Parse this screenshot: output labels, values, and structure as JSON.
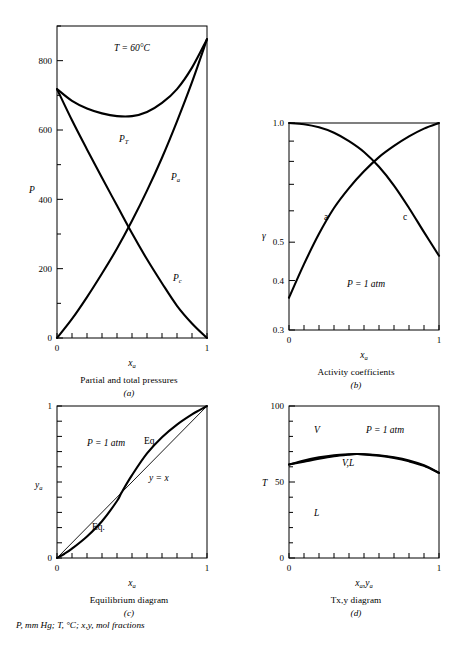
{
  "figure": {
    "footnote": "P, mm Hg; T, °C; x,y, mol fractions"
  },
  "panels": {
    "a": {
      "caption": "Partial and total pressures",
      "sublabel": "(a)",
      "annotation": "T  =  60°C",
      "ylabel": "P",
      "xlabel_main": "x",
      "xlabel_sub": "a",
      "x_ticks": [
        "0",
        "1"
      ],
      "y_ticks": [
        "200",
        "400",
        "600",
        "800"
      ],
      "y_zero": "0",
      "curve_labels": [
        {
          "main": "P",
          "sub": "T"
        },
        {
          "main": "P",
          "sub": "a"
        },
        {
          "main": "P",
          "sub": "c"
        }
      ]
    },
    "b": {
      "caption": "Activity coefficients",
      "sublabel": "(b)",
      "annotation": "P  =  1 atm",
      "ylabel": "γ",
      "xlabel_main": "x",
      "xlabel_sub": "a",
      "x_ticks": [
        "0",
        "1"
      ],
      "y_ticks": [
        "1.0",
        "0.5",
        "0.4",
        "0.3"
      ],
      "curve_labels": [
        "a",
        "c"
      ]
    },
    "c": {
      "caption": "Equilibrium diagram",
      "sublabel": "(c)",
      "annotation": "P  =  1 atm",
      "ylabel_main": "y",
      "ylabel_sub": "a",
      "xlabel_main": "x",
      "xlabel_sub": "a",
      "x_ticks": [
        "0",
        "1"
      ],
      "y_ticks": [
        "0",
        "1"
      ],
      "curve_labels": [
        "Eq.",
        "Eq."
      ],
      "diagonal_label": "y  =  x"
    },
    "d": {
      "caption": "Tx,y diagram",
      "sublabel": "(d)",
      "annotation": "P  =  1 atm",
      "ylabel": "T",
      "xlabel_main_1": "x",
      "xlabel_sub_1": "a",
      "xlabel_main_2": "y",
      "xlabel_sub_2": "a",
      "x_ticks": [
        "0",
        "1"
      ],
      "y_ticks": [
        "0",
        "50",
        "100"
      ],
      "region_labels": [
        "V",
        "V,L",
        "L"
      ]
    }
  },
  "chart_data": [
    {
      "type": "line",
      "panel": "a",
      "title": "Partial and total pressures",
      "xlabel": "x_a",
      "ylabel": "P",
      "xlim": [
        0,
        1
      ],
      "ylim": [
        0,
        900
      ],
      "y_tick_values": [
        0,
        200,
        400,
        600,
        800
      ],
      "y_minor_step": 100,
      "x_tick_values": [
        0,
        1
      ],
      "x_minor_count": 9,
      "grid": false,
      "annotation": "T = 60°C",
      "series": [
        {
          "name": "P_T",
          "label": "P_T",
          "x": [
            0,
            0.1,
            0.2,
            0.3,
            0.4,
            0.5,
            0.6,
            0.7,
            0.8,
            0.9,
            1.0
          ],
          "values": [
            718,
            684,
            662,
            648,
            640,
            640,
            652,
            678,
            718,
            780,
            862
          ]
        },
        {
          "name": "P_a",
          "label": "P_a",
          "x": [
            0,
            0.1,
            0.2,
            0.3,
            0.4,
            0.5,
            0.6,
            0.7,
            0.8,
            0.9,
            1.0
          ],
          "values": [
            0,
            55,
            118,
            186,
            258,
            338,
            425,
            520,
            625,
            738,
            862
          ]
        },
        {
          "name": "P_c",
          "label": "P_c",
          "x": [
            0,
            0.1,
            0.2,
            0.3,
            0.4,
            0.5,
            0.6,
            0.7,
            0.8,
            0.9,
            1.0
          ],
          "values": [
            718,
            628,
            544,
            462,
            382,
            302,
            227,
            158,
            93,
            42,
            0
          ]
        }
      ]
    },
    {
      "type": "line",
      "panel": "b",
      "title": "Activity coefficients",
      "xlabel": "x_a",
      "ylabel": "γ",
      "xlim": [
        0,
        1
      ],
      "ylim": [
        0.3,
        1.0
      ],
      "yscale": "log",
      "y_tick_values": [
        0.3,
        0.4,
        0.5,
        0.6,
        0.7,
        0.8,
        0.9,
        1.0
      ],
      "y_labeled_ticks": [
        0.3,
        0.4,
        0.5,
        1.0
      ],
      "x_tick_values": [
        0,
        1
      ],
      "x_minor_count": 9,
      "grid": false,
      "annotation": "P = 1 atm",
      "series": [
        {
          "name": "gamma_a",
          "label": "a",
          "x": [
            0,
            0.1,
            0.2,
            0.3,
            0.4,
            0.5,
            0.6,
            0.7,
            0.8,
            0.9,
            1.0
          ],
          "values": [
            0.362,
            0.44,
            0.525,
            0.61,
            0.685,
            0.755,
            0.82,
            0.875,
            0.925,
            0.968,
            1.0
          ]
        },
        {
          "name": "gamma_c",
          "label": "c",
          "x": [
            0,
            0.1,
            0.2,
            0.3,
            0.4,
            0.5,
            0.6,
            0.7,
            0.8,
            0.9,
            1.0
          ],
          "values": [
            1.0,
            0.993,
            0.975,
            0.945,
            0.9,
            0.845,
            0.775,
            0.695,
            0.61,
            0.53,
            0.462
          ]
        }
      ]
    },
    {
      "type": "line",
      "panel": "c",
      "title": "Equilibrium diagram",
      "xlabel": "x_a",
      "ylabel": "y_a",
      "xlim": [
        0,
        1
      ],
      "ylim": [
        0,
        1
      ],
      "y_tick_values": [
        0,
        1
      ],
      "x_tick_values": [
        0,
        1
      ],
      "x_minor_count": 9,
      "y_minor_count": 9,
      "grid": false,
      "annotation": "P = 1 atm",
      "azeotrope_x": 0.43,
      "series": [
        {
          "name": "equilibrium",
          "label": "Eq.",
          "x": [
            0,
            0.05,
            0.1,
            0.2,
            0.3,
            0.4,
            0.43,
            0.5,
            0.6,
            0.7,
            0.8,
            0.9,
            0.95,
            1.0
          ],
          "values": [
            0,
            0.028,
            0.062,
            0.142,
            0.242,
            0.375,
            0.43,
            0.545,
            0.688,
            0.795,
            0.878,
            0.945,
            0.973,
            1.0
          ]
        },
        {
          "name": "y_equals_x",
          "label": "y  =  x",
          "x": [
            0,
            1
          ],
          "values": [
            0,
            1
          ],
          "style": "thin"
        }
      ]
    },
    {
      "type": "line",
      "panel": "d",
      "title": "Tx,y diagram",
      "xlabel": "x_a,y_a",
      "ylabel": "T",
      "xlim": [
        0,
        1
      ],
      "ylim": [
        0,
        100
      ],
      "y_tick_values": [
        0,
        50,
        100
      ],
      "y_minor_step": 10,
      "x_tick_values": [
        0,
        1
      ],
      "x_minor_count": 9,
      "grid": false,
      "annotation": "P = 1 atm",
      "region_labels": [
        "V",
        "V,L",
        "L"
      ],
      "series": [
        {
          "name": "dew_point",
          "label": "V",
          "x": [
            0,
            0.1,
            0.2,
            0.3,
            0.4,
            0.45,
            0.5,
            0.6,
            0.7,
            0.8,
            0.9,
            1.0
          ],
          "values": [
            61.5,
            64.2,
            66.2,
            67.6,
            68.3,
            68.4,
            68.3,
            67.6,
            66.3,
            64.2,
            61.0,
            56.0
          ]
        },
        {
          "name": "bubble_point",
          "label": "L",
          "x": [
            0,
            0.1,
            0.2,
            0.3,
            0.4,
            0.45,
            0.5,
            0.6,
            0.7,
            0.8,
            0.9,
            1.0
          ],
          "values": [
            61.5,
            63.4,
            65.3,
            66.9,
            68.0,
            68.4,
            68.2,
            67.3,
            65.8,
            63.6,
            60.6,
            56.0
          ]
        }
      ]
    }
  ]
}
